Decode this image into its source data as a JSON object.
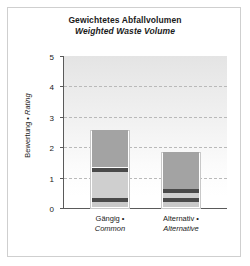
{
  "chart_data": {
    "type": "bar",
    "title": "Gewichtetes Abfallvolumen",
    "subtitle": "Weighted Waste Volume",
    "xlabel": "",
    "ylabel": "Bewertung • Rating",
    "ylabel_de": "Bewertung •",
    "ylabel_en": "Rating",
    "ylim": [
      0,
      5
    ],
    "yticks": [
      0,
      1,
      2,
      3,
      4,
      5
    ],
    "ytick_labels": [
      "0",
      "1",
      "2",
      "3",
      "4",
      "5"
    ],
    "grid": "horizontal-dashed",
    "legend": "none",
    "stacked": true,
    "categories": [
      "Gängig • Common",
      "Alternativ • Alternative"
    ],
    "category_lines": [
      {
        "line1": "Gängig •",
        "line2": "Common"
      },
      {
        "line1": "Alternativ •",
        "line2": "Alternative"
      }
    ],
    "totals": [
      2.52,
      1.82
    ],
    "series": [
      {
        "name": "segment-1-base-light",
        "color": "#c9c9c9",
        "values": [
          0.15,
          0.15
        ]
      },
      {
        "name": "segment-2-dark-band-lower",
        "color": "#4a4a4a",
        "values": [
          0.15,
          0.15
        ]
      },
      {
        "name": "segment-3-light",
        "color": "#cfcfcf",
        "values": [
          0.85,
          0.15
        ]
      },
      {
        "name": "segment-4-dark-band-upper",
        "color": "#4a4a4a",
        "values": [
          0.15,
          0.15
        ]
      },
      {
        "name": "segment-5-medium-gray-top",
        "color": "#a3a3a3",
        "values": [
          1.22,
          1.22
        ]
      }
    ]
  },
  "colors": {
    "plot_background_top": "#e4e4e4",
    "plot_background_bottom": "#ffffff",
    "axis": "#5a5a5a",
    "gridline": "#b9b9b9",
    "frame": "#cfcfcf",
    "text": "#1a1a1a",
    "bar_dark": "#4a4a4a",
    "bar_medium": "#a3a3a3",
    "bar_light": "#cfcfcf"
  }
}
